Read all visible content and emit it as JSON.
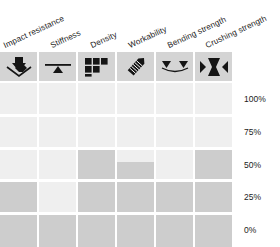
{
  "chart_data": {
    "type": "bar",
    "title": "",
    "xlabel": "",
    "ylabel": "",
    "ylim": [
      0,
      100
    ],
    "grid": true,
    "legend": "none",
    "orientation": "vertical",
    "categories": [
      "Impact resistance",
      "Stiffness",
      "Density",
      "Workability",
      "Bending strength",
      "Crushing strength"
    ],
    "values": [
      40,
      20,
      60,
      52,
      40,
      60
    ],
    "tick_labels": [
      "100%",
      "75%",
      "50%",
      "25%",
      "0%"
    ],
    "tick_values": [
      100,
      75,
      50,
      25,
      0
    ],
    "bar_color": "#cdcdcd",
    "track_color": "#efefef",
    "icon_box_color": "#d4d4d4"
  },
  "columns": [
    {
      "label": "Impact resistance",
      "icon": "impact-arrow-down-icon",
      "value": 40,
      "value_label": "40%"
    },
    {
      "label": "Stiffness",
      "icon": "stiffness-beam-fulcrum-icon",
      "value": 20,
      "value_label": "20%"
    },
    {
      "label": "Density",
      "icon": "density-blocks-icon",
      "value": 60,
      "value_label": "60%"
    },
    {
      "label": "Workability",
      "icon": "workability-chisel-icon",
      "value": 52,
      "value_label": "52%"
    },
    {
      "label": "Bending strength",
      "icon": "bending-two-arrows-icon",
      "value": 40,
      "value_label": "40%"
    },
    {
      "label": "Crushing strength",
      "icon": "crushing-hourglass-icon",
      "value": 60,
      "value_label": "60%"
    }
  ],
  "axis": {
    "ticks": [
      {
        "label": "100%"
      },
      {
        "label": "75%"
      },
      {
        "label": "50%"
      },
      {
        "label": "25%"
      },
      {
        "label": "0%"
      }
    ]
  }
}
